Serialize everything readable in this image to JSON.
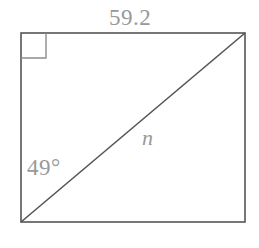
{
  "figure": {
    "type": "geometry-diagram",
    "shape": "rectangle-with-diagonal",
    "background_color": "#ffffff",
    "stroke_color": "#555555",
    "label_color": "#999999",
    "rectangle": {
      "left": 21,
      "top": 33,
      "right": 245,
      "bottom": 222,
      "width": 224,
      "height": 189
    },
    "diagonal": {
      "from": [
        21,
        222
      ],
      "to": [
        245,
        33
      ]
    },
    "right_angle_marker": {
      "corner": "top-left",
      "size": 25
    },
    "labels": {
      "top_side": "59.2",
      "angle": "49°",
      "diagonal": "n"
    }
  }
}
